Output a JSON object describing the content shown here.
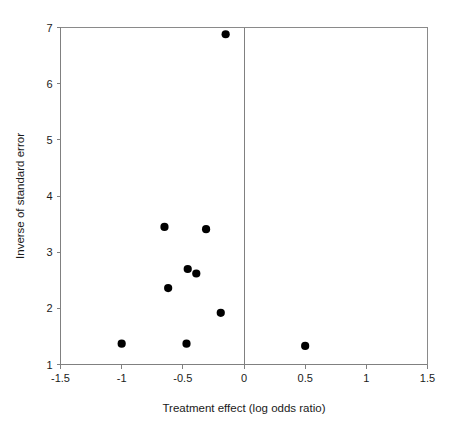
{
  "chart_data": {
    "type": "scatter",
    "title": "",
    "subtitle": "",
    "xlabel": "Treatment effect (log odds ratio)",
    "ylabel": "Inverse of standard error",
    "xlim": [
      -1.5,
      1.5
    ],
    "ylim": [
      1,
      7
    ],
    "xticks": [
      -1.5,
      -1,
      -0.5,
      0,
      0.5,
      1,
      1.5
    ],
    "xtick_labels": [
      "-1.5",
      "-1",
      "-0.5",
      "0",
      "0.5",
      "1",
      "1.5"
    ],
    "yticks": [
      1,
      2,
      3,
      4,
      5,
      6,
      7
    ],
    "ytick_labels": [
      "1",
      "2",
      "3",
      "4",
      "5",
      "6",
      "7"
    ],
    "grid": false,
    "legend": "none",
    "reference_lines": [
      {
        "name": "null-effect-line",
        "orientation": "vertical",
        "value": 0
      }
    ],
    "marker": {
      "shape": "circle",
      "color": "#000000",
      "size": 5
    },
    "points": [
      {
        "x": -0.15,
        "y": 6.88
      },
      {
        "x": -0.65,
        "y": 3.45
      },
      {
        "x": -0.31,
        "y": 3.41
      },
      {
        "x": -0.46,
        "y": 2.7
      },
      {
        "x": -0.39,
        "y": 2.62
      },
      {
        "x": -0.62,
        "y": 2.36
      },
      {
        "x": -0.19,
        "y": 1.92
      },
      {
        "x": -1.0,
        "y": 1.37
      },
      {
        "x": -0.47,
        "y": 1.37
      },
      {
        "x": 0.5,
        "y": 1.33
      }
    ]
  },
  "figure": {
    "name": "funnel-plot"
  }
}
